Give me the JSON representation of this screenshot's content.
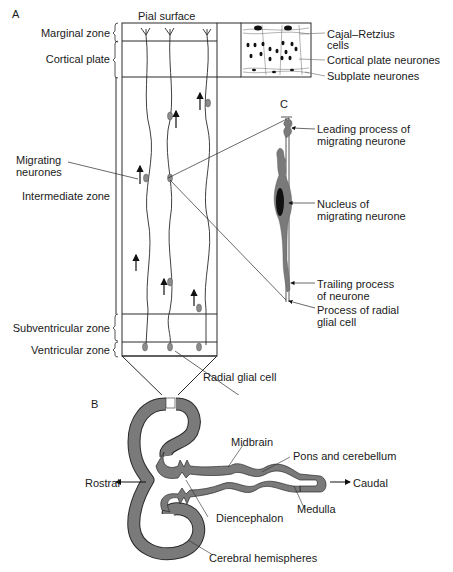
{
  "panels": {
    "a": "A",
    "b": "B",
    "c": "C"
  },
  "panel_a": {
    "top_label": "Pial surface",
    "zones": [
      {
        "label": "Marginal zone"
      },
      {
        "label": "Cortical plate"
      },
      {
        "label": "Intermediate zone"
      },
      {
        "label": "Subventricular zone"
      },
      {
        "label": "Ventricular zone"
      }
    ],
    "migrating_neurones": "Migrating\nneurones",
    "migrating_line1": "Migrating",
    "migrating_line2": "neurones",
    "radial_glial_cell": "Radial glial cell",
    "inset_labels": {
      "cajal_line1": "Cajal–Retzius",
      "cajal_line2": "cells",
      "cortical_plate_neurones": "Cortical plate neurones",
      "subplate_neurones": "Subplate neurones"
    }
  },
  "panel_c": {
    "leading_line1": "Leading process of",
    "leading_line2": "migrating neurone",
    "nucleus_line1": "Nucleus of",
    "nucleus_line2": "migrating neurone",
    "trailing_line1": "Trailing process",
    "trailing_line2": "of neurone",
    "glial_line1": "Process of radial",
    "glial_line2": "glial cell"
  },
  "panel_b": {
    "rostral": "Rostral",
    "caudal": "Caudal",
    "midbrain": "Midbrain",
    "pons": "Pons and cerebellum",
    "diencephalon": "Diencephalon",
    "medulla": "Medulla",
    "cerebral": "Cerebral hemispheres"
  },
  "colors": {
    "line": "#2a2a2a",
    "tissue_fill": "#7a7a7a",
    "cell_fill": "#8c8c8c",
    "nucleus_fill": "#111111"
  }
}
